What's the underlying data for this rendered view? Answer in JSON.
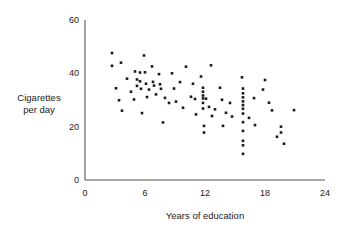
{
  "chart_data": {
    "type": "scatter",
    "title": "",
    "xlabel": "Years of education",
    "ylabel": "Cigarettes per day",
    "ylabel_lines": [
      "Cigarettes",
      "per day"
    ],
    "xlim": [
      0,
      24
    ],
    "ylim": [
      0,
      60
    ],
    "xticks": [
      0,
      6,
      12,
      18,
      24
    ],
    "xtick_labels": [
      "0",
      "6",
      "12",
      "18",
      "24"
    ],
    "yticks": [
      0,
      20,
      40,
      60
    ],
    "ytick_labels": [
      "0",
      "20",
      "40",
      "60"
    ],
    "grid": false,
    "legend": null,
    "marker": {
      "shape": "square",
      "size_px": 2.6,
      "color": "#1a1a1a"
    },
    "axis_color": "#555555",
    "background": "#ffffff",
    "n_points": 86,
    "points": [
      {
        "x": 2.7,
        "y": 47.6
      },
      {
        "x": 2.7,
        "y": 42.8
      },
      {
        "x": 3.1,
        "y": 34.4
      },
      {
        "x": 3.6,
        "y": 44.0
      },
      {
        "x": 3.7,
        "y": 26.0
      },
      {
        "x": 4.6,
        "y": 33.1
      },
      {
        "x": 5.0,
        "y": 40.7
      },
      {
        "x": 5.2,
        "y": 37.7
      },
      {
        "x": 5.2,
        "y": 35.3
      },
      {
        "x": 5.5,
        "y": 40.3
      },
      {
        "x": 5.5,
        "y": 37.0
      },
      {
        "x": 5.6,
        "y": 34.2
      },
      {
        "x": 5.7,
        "y": 25.1
      },
      {
        "x": 5.9,
        "y": 46.7
      },
      {
        "x": 6.0,
        "y": 40.4
      },
      {
        "x": 6.1,
        "y": 36.1
      },
      {
        "x": 6.2,
        "y": 31.1
      },
      {
        "x": 6.7,
        "y": 42.6
      },
      {
        "x": 6.8,
        "y": 36.8
      },
      {
        "x": 6.9,
        "y": 35.4
      },
      {
        "x": 7.4,
        "y": 39.7
      },
      {
        "x": 7.5,
        "y": 35.9
      },
      {
        "x": 7.6,
        "y": 34.2
      },
      {
        "x": 7.8,
        "y": 21.6
      },
      {
        "x": 8.4,
        "y": 28.9
      },
      {
        "x": 8.7,
        "y": 40.0
      },
      {
        "x": 8.9,
        "y": 34.3
      },
      {
        "x": 9.5,
        "y": 36.7
      },
      {
        "x": 10.1,
        "y": 42.5
      },
      {
        "x": 10.8,
        "y": 36.1
      },
      {
        "x": 11.0,
        "y": 30.4
      },
      {
        "x": 11.1,
        "y": 24.6
      },
      {
        "x": 11.6,
        "y": 38.8
      },
      {
        "x": 11.8,
        "y": 34.6
      },
      {
        "x": 11.8,
        "y": 33.1
      },
      {
        "x": 11.8,
        "y": 31.7
      },
      {
        "x": 11.8,
        "y": 30.6
      },
      {
        "x": 11.8,
        "y": 28.9
      },
      {
        "x": 11.8,
        "y": 26.8
      },
      {
        "x": 11.9,
        "y": 20.3
      },
      {
        "x": 11.9,
        "y": 17.8
      },
      {
        "x": 12.1,
        "y": 30.5
      },
      {
        "x": 12.6,
        "y": 43.0
      },
      {
        "x": 12.7,
        "y": 24.0
      },
      {
        "x": 13.5,
        "y": 34.6
      },
      {
        "x": 13.7,
        "y": 30.1
      },
      {
        "x": 13.8,
        "y": 20.3
      },
      {
        "x": 14.5,
        "y": 28.9
      },
      {
        "x": 14.7,
        "y": 23.8
      },
      {
        "x": 15.7,
        "y": 38.5
      },
      {
        "x": 15.8,
        "y": 34.3
      },
      {
        "x": 15.8,
        "y": 32.5
      },
      {
        "x": 15.8,
        "y": 31.0
      },
      {
        "x": 15.8,
        "y": 29.5
      },
      {
        "x": 15.8,
        "y": 28.1
      },
      {
        "x": 15.8,
        "y": 26.7
      },
      {
        "x": 15.8,
        "y": 24.9
      },
      {
        "x": 15.8,
        "y": 21.7
      },
      {
        "x": 15.8,
        "y": 18.4
      },
      {
        "x": 15.8,
        "y": 14.7
      },
      {
        "x": 15.8,
        "y": 13.0
      },
      {
        "x": 15.8,
        "y": 9.8
      },
      {
        "x": 16.9,
        "y": 30.7
      },
      {
        "x": 17.0,
        "y": 20.6
      },
      {
        "x": 17.8,
        "y": 33.9
      },
      {
        "x": 18.0,
        "y": 37.5
      },
      {
        "x": 18.7,
        "y": 26.1
      },
      {
        "x": 19.2,
        "y": 16.2
      },
      {
        "x": 19.6,
        "y": 20.0
      },
      {
        "x": 19.6,
        "y": 17.8
      },
      {
        "x": 19.9,
        "y": 13.6
      },
      {
        "x": 20.9,
        "y": 26.2
      },
      {
        "x": 4.2,
        "y": 38.0
      },
      {
        "x": 6.4,
        "y": 33.9
      },
      {
        "x": 9.1,
        "y": 29.4
      },
      {
        "x": 10.6,
        "y": 31.2
      },
      {
        "x": 12.4,
        "y": 27.4
      },
      {
        "x": 13.0,
        "y": 26.5
      },
      {
        "x": 7.1,
        "y": 32.1
      },
      {
        "x": 8.0,
        "y": 30.8
      },
      {
        "x": 4.9,
        "y": 30.2
      },
      {
        "x": 14.1,
        "y": 25.2
      },
      {
        "x": 16.4,
        "y": 23.3
      },
      {
        "x": 18.4,
        "y": 29.0
      },
      {
        "x": 3.4,
        "y": 29.9
      },
      {
        "x": 9.8,
        "y": 27.1
      }
    ]
  }
}
